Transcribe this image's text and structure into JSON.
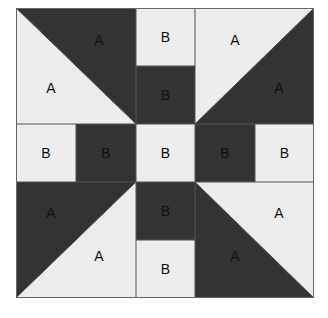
{
  "diagram": {
    "colors": {
      "dark": "#333333",
      "light": "#ececec",
      "line": "#555555",
      "text": "#111111"
    },
    "grid": {
      "cols": 5,
      "rows": 5
    },
    "cells": [
      {
        "id": "top-center-square",
        "label": "B",
        "shade": "light"
      },
      {
        "id": "upper-center-square",
        "label": "B",
        "shade": "dark"
      },
      {
        "id": "middle-far-left-square",
        "label": "B",
        "shade": "light"
      },
      {
        "id": "middle-left-square",
        "label": "B",
        "shade": "dark"
      },
      {
        "id": "center-square",
        "label": "B",
        "shade": "light"
      },
      {
        "id": "middle-right-square",
        "label": "B",
        "shade": "dark"
      },
      {
        "id": "middle-far-right-square",
        "label": "B",
        "shade": "light"
      },
      {
        "id": "lower-center-square",
        "label": "B",
        "shade": "dark"
      },
      {
        "id": "bottom-center-square",
        "label": "B",
        "shade": "light"
      }
    ],
    "triangles": {
      "top_left": {
        "dark_label": "A",
        "light_label": "A"
      },
      "top_right": {
        "dark_label": "A",
        "light_label": "A"
      },
      "bottom_left": {
        "dark_label": "A",
        "light_label": "A"
      },
      "bottom_right": {
        "dark_label": "A",
        "light_label": "A"
      }
    }
  }
}
